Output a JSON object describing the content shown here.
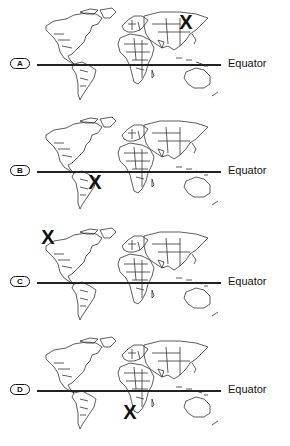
{
  "equator_label": "Equator",
  "panels": [
    {
      "option": "A",
      "marker": "X",
      "marker_location": "northeastern Russia (Siberia)",
      "top": 0,
      "equator_y": 64,
      "x_pos": [
        186,
        22
      ]
    },
    {
      "option": "B",
      "marker": "X",
      "marker_location": "Brazil, south of the equator",
      "top": 110,
      "equator_y": 61,
      "x_pos": [
        95,
        72
      ]
    },
    {
      "option": "C",
      "marker": "X",
      "marker_location": "Alaska",
      "top": 220,
      "equator_y": 62,
      "x_pos": [
        48,
        17
      ]
    },
    {
      "option": "D",
      "marker": "X",
      "marker_location": "southern Africa",
      "top": 330,
      "equator_y": 60,
      "x_pos": [
        130,
        82
      ]
    }
  ],
  "colors": {
    "ink": "#111111",
    "background": "#ffffff",
    "land_outline": "#333333"
  }
}
